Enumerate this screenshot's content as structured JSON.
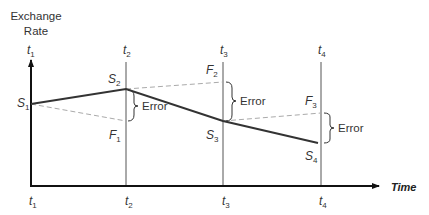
{
  "diagram": {
    "y_axis_label_line1": "Exchange",
    "y_axis_label_line2": "Rate",
    "x_axis_label": "Time",
    "top_time_labels": [
      {
        "base": "t",
        "sub": "1"
      },
      {
        "base": "t",
        "sub": "2"
      },
      {
        "base": "t",
        "sub": "3"
      },
      {
        "base": "t",
        "sub": "4"
      }
    ],
    "bottom_time_labels": [
      {
        "base": "t",
        "sub": "1"
      },
      {
        "base": "t",
        "sub": "2"
      },
      {
        "base": "t",
        "sub": "3"
      },
      {
        "base": "t",
        "sub": "4"
      }
    ],
    "spot_labels": [
      {
        "base": "S",
        "sub": "1"
      },
      {
        "base": "S",
        "sub": "2"
      },
      {
        "base": "S",
        "sub": "3"
      },
      {
        "base": "S",
        "sub": "4"
      }
    ],
    "forward_labels": [
      {
        "base": "F",
        "sub": "1"
      },
      {
        "base": "F",
        "sub": "2"
      },
      {
        "base": "F",
        "sub": "3"
      }
    ],
    "error_labels": [
      "Error",
      "Error",
      "Error"
    ],
    "colors": {
      "axis": "#111111",
      "spot_line": "#333333",
      "forward_dashed": "#aaaaaa",
      "time_gridline": "#555555",
      "text": "#333333"
    }
  }
}
